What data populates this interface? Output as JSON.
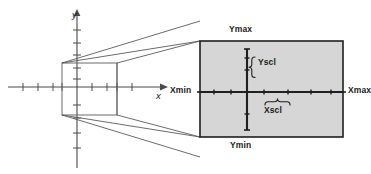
{
  "figure": {
    "colors": {
      "window_fill": "#d6d6d6",
      "window_border": "#1f1f1f",
      "axis_line": "#4a4a4a",
      "perspective_line": "#5a5a5a",
      "label_text": "#1a1a1a"
    },
    "plane": {
      "x_axis_label": "x",
      "y_axis_label": "y",
      "x_tick_count": 10,
      "y_tick_count": 9
    },
    "window_labels": {
      "xmin": "Xmin",
      "xmax": "Xmax",
      "ymin": "Ymin",
      "ymax": "Ymax",
      "xscl": "Xscl",
      "yscl": "Yscl"
    },
    "window": {
      "left": 200,
      "top": 41,
      "width": 143,
      "height": 96,
      "origin_x": 247,
      "origin_y": 92,
      "x_tick_spacing": 24,
      "y_tick_spacing": 22
    }
  }
}
